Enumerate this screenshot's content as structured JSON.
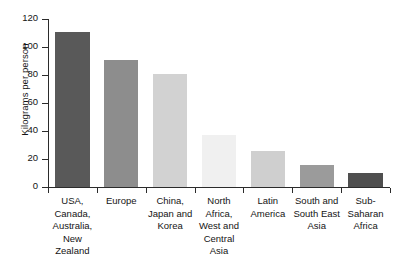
{
  "chart_data": {
    "type": "bar",
    "title": "",
    "subtitle": "",
    "xlabel": "",
    "ylabel": "Kilograms per person",
    "ylim": [
      0,
      120
    ],
    "yticks": [
      0,
      20,
      40,
      60,
      80,
      100,
      120
    ],
    "ytick_labels": [
      "0",
      "20",
      "40",
      "60",
      "80",
      "100",
      "120"
    ],
    "grid": false,
    "legend": null,
    "categories": [
      "USA, Canada, Australia, New Zealand",
      "Europe",
      "China, Japan and Korea",
      "North Africa, West and Central Asia",
      "Latin America",
      "South and South East Asia",
      "Sub-Saharan Africa"
    ],
    "category_lines": [
      [
        "USA,",
        "Canada,",
        "Australia,",
        "New",
        "Zealand"
      ],
      [
        "Europe"
      ],
      [
        "China,",
        "Japan and",
        "Korea"
      ],
      [
        "North",
        "Africa,",
        "West and",
        "Central",
        "Asia"
      ],
      [
        "Latin",
        "America"
      ],
      [
        "South and",
        "South East",
        "Asia"
      ],
      [
        "Sub-",
        "Saharan",
        "Africa"
      ]
    ],
    "values": [
      111,
      91,
      81,
      37,
      26,
      16,
      10
    ],
    "bar_colors": [
      "#595959",
      "#8d8d8d",
      "#d2d2d2",
      "#f0f0f0",
      "#cfcfcf",
      "#9b9b9b",
      "#4f4f4f"
    ]
  },
  "axis": {
    "y_title": "Kilograms per person"
  }
}
